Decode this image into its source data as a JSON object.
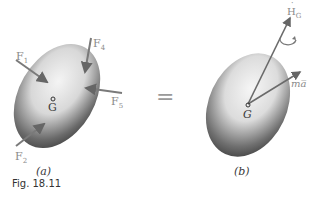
{
  "figure": {
    "caption": "Fig. 18.11",
    "panel_a": {
      "label": "(a)",
      "center_label": "G",
      "forces": [
        {
          "name": "F",
          "sub": "1"
        },
        {
          "name": "F",
          "sub": "2"
        },
        {
          "name": "F",
          "sub": "4"
        },
        {
          "name": "F",
          "sub": "5"
        }
      ]
    },
    "equals_sign": "=",
    "panel_b": {
      "label": "(b)",
      "center_label": "G",
      "angular_momentum_rate": {
        "name": "H",
        "sub": "G",
        "dot": "˙"
      },
      "linear_term": "ma̅"
    }
  }
}
